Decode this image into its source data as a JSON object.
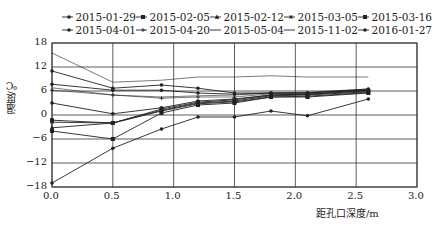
{
  "chart_data": {
    "type": "line",
    "title": "",
    "xlabel": "距孔口深度/m",
    "ylabel": "温度/℃",
    "xlim": [
      0,
      3.0
    ],
    "ylim": [
      -18,
      18
    ],
    "x_ticks": [
      "0.0",
      "0.5",
      "1.0",
      "1.5",
      "2.0",
      "2.5",
      "3.0"
    ],
    "y_ticks": [
      "18",
      "12",
      "6",
      "0",
      "-6",
      "-12",
      "-18"
    ],
    "grid": true,
    "legend_position": "top",
    "x": [
      0,
      0.5,
      0.9,
      1.2,
      1.5,
      1.8,
      2.1,
      2.6
    ],
    "series": [
      {
        "name": "2015-01-29",
        "marker": "dot",
        "values": [
          -17,
          -8.3,
          -3.5,
          -0.5,
          -0.5,
          1,
          -0.2,
          4
        ]
      },
      {
        "name": "2015-02-05",
        "marker": "square",
        "values": [
          -4,
          -6,
          0.5,
          2.5,
          3,
          4.5,
          4.5,
          5.5
        ]
      },
      {
        "name": "2015-02-12",
        "marker": "triangle",
        "values": [
          -3.2,
          -2,
          1,
          2.8,
          3.3,
          4.5,
          4.7,
          5.6
        ]
      },
      {
        "name": "2015-03-05",
        "marker": "star",
        "values": [
          -1.8,
          -2,
          1.2,
          3,
          3.5,
          4.8,
          5,
          5.8
        ]
      },
      {
        "name": "2015-03-16",
        "marker": "square",
        "values": [
          -1.3,
          -2,
          1.5,
          3.2,
          3.8,
          5,
          5.2,
          6
        ]
      },
      {
        "name": "2015-04-01",
        "marker": "dot",
        "values": [
          3,
          0.3,
          1.8,
          3.5,
          4,
          5,
          5.2,
          6.2
        ]
      },
      {
        "name": "2015-04-20",
        "marker": "plus",
        "values": [
          6.2,
          5,
          4.2,
          4.5,
          4.5,
          5.3,
          5.5,
          6.3
        ]
      },
      {
        "name": "2015-05-04",
        "marker": "none",
        "values": [
          6.8,
          5,
          4.5,
          4.8,
          5,
          5.5,
          5.7,
          6.5
        ]
      },
      {
        "name": "2015-11-02",
        "marker": "none",
        "values": [
          15.5,
          8.2,
          8.7,
          9.5,
          9.5,
          9.8,
          9.5,
          9.5
        ]
      },
      {
        "name": "2016-01-27",
        "marker": "dot",
        "values": [
          11,
          6.7,
          7.5,
          6.7,
          5.5,
          5.5,
          5.5,
          6.5
        ]
      },
      {
        "name": "extra-7.7",
        "marker": "dot",
        "values": [
          7.7,
          6.2,
          6.2,
          5.5,
          5.2,
          5.5,
          5.5,
          6.3
        ]
      }
    ]
  },
  "legend": {
    "row1": [
      "2015-01-29",
      "2015-02-05",
      "2015-02-12",
      "2015-03-05",
      "2015-03-16"
    ],
    "row2": [
      "2015-04-01",
      "2015-04-20",
      "2015-05-04",
      "2015-11-02",
      "2016-01-27"
    ]
  },
  "axes": {
    "xlabel": "距孔口深度/m",
    "ylabel": "温度/℃"
  },
  "colors": {
    "line": "#222222",
    "grid": "#333333",
    "background": "#ffffff"
  }
}
